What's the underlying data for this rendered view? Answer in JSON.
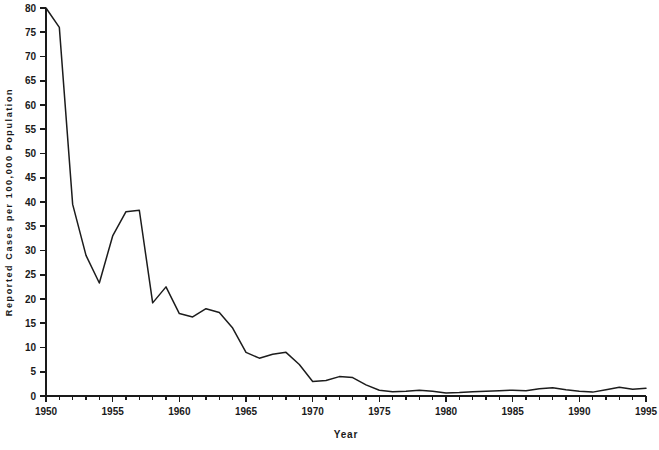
{
  "chart_data": {
    "type": "line",
    "title": "",
    "subtitle": "",
    "xlabel": "Year",
    "ylabel": "Reported Cases per 100,000 Population",
    "xlim": [
      1950,
      1995
    ],
    "ylim": [
      0,
      80
    ],
    "grid": false,
    "legend": null,
    "line_color": "#1c1c1c",
    "axis_color": "#1a1a1a",
    "background_color": "#ffffff",
    "x_tick_labels": [
      "1950",
      "1955",
      "1960",
      "1965",
      "1970",
      "1975",
      "1980",
      "1985",
      "1990",
      "1995"
    ],
    "x_tick_values": [
      1950,
      1955,
      1960,
      1965,
      1970,
      1975,
      1980,
      1985,
      1990,
      1995
    ],
    "x_minor_tick_interval": 1,
    "y_tick_labels": [
      "0",
      "5",
      "10",
      "15",
      "20",
      "25",
      "30",
      "35",
      "40",
      "45",
      "50",
      "55",
      "60",
      "65",
      "70",
      "75",
      "80"
    ],
    "y_tick_values": [
      0,
      5,
      10,
      15,
      20,
      25,
      30,
      35,
      40,
      45,
      50,
      55,
      60,
      65,
      70,
      75,
      80
    ],
    "x": [
      1950,
      1951,
      1952,
      1953,
      1954,
      1955,
      1956,
      1957,
      1958,
      1959,
      1960,
      1961,
      1962,
      1963,
      1964,
      1965,
      1966,
      1967,
      1968,
      1969,
      1970,
      1971,
      1972,
      1973,
      1974,
      1975,
      1976,
      1977,
      1978,
      1979,
      1980,
      1981,
      1982,
      1983,
      1984,
      1985,
      1986,
      1987,
      1988,
      1989,
      1990,
      1991,
      1992,
      1993,
      1994,
      1995
    ],
    "values": [
      80.0,
      76.0,
      39.5,
      29.0,
      23.3,
      33.0,
      38.0,
      38.3,
      19.2,
      22.5,
      17.0,
      16.3,
      18.0,
      17.2,
      14.0,
      9.0,
      7.8,
      8.6,
      9.0,
      6.5,
      3.0,
      3.2,
      4.0,
      3.8,
      2.3,
      1.2,
      0.9,
      1.0,
      1.2,
      1.0,
      0.6,
      0.7,
      0.9,
      1.0,
      1.1,
      1.2,
      1.1,
      1.5,
      1.7,
      1.3,
      1.0,
      0.8,
      1.3,
      1.8,
      1.4,
      1.6
    ]
  },
  "geometry": {
    "plot_left": 46,
    "plot_right": 646,
    "plot_top": 8,
    "plot_bottom": 396,
    "tick_major_len": 6,
    "tick_minor_len": 3.5
  }
}
